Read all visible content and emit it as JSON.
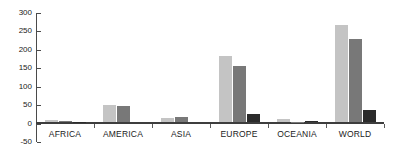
{
  "chart_data": {
    "type": "bar",
    "title": "",
    "xlabel": "",
    "ylabel": "",
    "ylim": [
      -50,
      300
    ],
    "yticks": [
      300,
      250,
      200,
      150,
      100,
      50,
      0,
      -50
    ],
    "grid": false,
    "legend": "none",
    "categories": [
      "AFRICA",
      "AMERICA",
      "ASIA",
      "EUROPE",
      "OCEANIA",
      "WORLD"
    ],
    "series": [
      {
        "name": "series-1",
        "color": "#c4c4c4",
        "values": [
          6,
          47,
          12,
          179,
          7,
          264
        ]
      },
      {
        "name": "series-2",
        "color": "#787878",
        "values": [
          2,
          44,
          14,
          152,
          1,
          225
        ]
      },
      {
        "name": "series-3",
        "color": "#2b2b2b",
        "values": [
          1,
          0,
          0,
          22,
          3,
          33
        ]
      }
    ]
  },
  "axis": {
    "y_tick_labels": [
      "300",
      "250",
      "200",
      "150",
      "100",
      "50",
      "0",
      "-50"
    ],
    "x_tick_labels": [
      "AFRICA",
      "AMERICA",
      "ASIA",
      "EUROPE",
      "OCEANIA",
      "WORLD"
    ]
  }
}
